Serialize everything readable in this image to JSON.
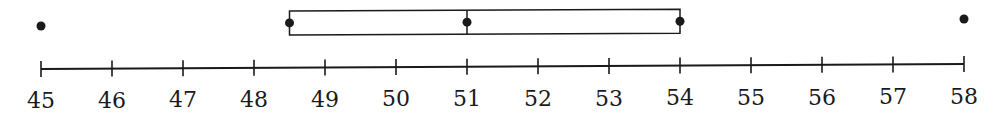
{
  "chart_data": {
    "type": "boxplot",
    "title": "",
    "xlabel": "",
    "ylabel": "",
    "xlim": [
      45,
      58
    ],
    "ticks": [
      45,
      46,
      47,
      48,
      49,
      50,
      51,
      52,
      53,
      54,
      55,
      56,
      57,
      58
    ],
    "tick_labels": [
      "45",
      "46",
      "47",
      "48",
      "49",
      "50",
      "51",
      "52",
      "53",
      "54",
      "55",
      "56",
      "57",
      "58"
    ],
    "grid": false,
    "legend": null,
    "box": {
      "q1": 48.5,
      "median": 51,
      "q3": 54,
      "marked_points": [
        48.5,
        51,
        54
      ]
    },
    "outliers": [
      45,
      58
    ],
    "whiskers": "none"
  },
  "colors": {
    "ink": "#1a1a1a",
    "background": "#ffffff"
  }
}
